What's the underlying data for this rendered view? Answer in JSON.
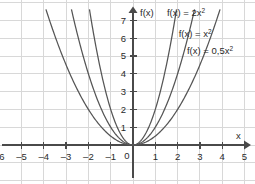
{
  "chart_data": {
    "type": "line",
    "title": "",
    "xlabel": "x",
    "ylabel": "f(x)",
    "xlim": [
      -6.5,
      5.6
    ],
    "ylim": [
      -1.3,
      7.6
    ],
    "grid": true,
    "legend_position": "in-plot-annotations",
    "x_ticks": [
      "-6",
      "-5",
      "-4",
      "-3",
      "-2",
      "-1",
      "0",
      "1",
      "2",
      "3",
      "4",
      "5"
    ],
    "x_tick_values": [
      -6,
      -5,
      -4,
      -3,
      -2,
      -1,
      0,
      1,
      2,
      3,
      4,
      5
    ],
    "y_ticks": [
      "1",
      "2",
      "3",
      "4",
      "5",
      "6",
      "7"
    ],
    "y_tick_values": [
      1,
      2,
      3,
      4,
      5,
      6,
      7
    ],
    "origin_label": "0",
    "series": [
      {
        "name": "f(x) = 2x²",
        "label_base": "f(x) = 2x",
        "label_exponent": "2",
        "coefficient": 2,
        "color": "#555555",
        "x": [
          -1.95,
          -1.5,
          -1.0,
          -0.5,
          0,
          0.5,
          1.0,
          1.5,
          1.95
        ],
        "y": [
          7.6,
          4.5,
          2.0,
          0.5,
          0,
          0.5,
          2.0,
          4.5,
          7.6
        ]
      },
      {
        "name": "f(x) = x²",
        "label_base": "f(x) = x",
        "label_exponent": "2",
        "coefficient": 1,
        "color": "#555555",
        "x": [
          -2.76,
          -2.0,
          -1.0,
          0,
          1.0,
          2.0,
          2.76
        ],
        "y": [
          7.6,
          4.0,
          1.0,
          0,
          1.0,
          4.0,
          7.6
        ]
      },
      {
        "name": "f(x) = 0,5x²",
        "label_base": "f(x) = 0,5x",
        "label_exponent": "2",
        "coefficient": 0.5,
        "color": "#555555",
        "x": [
          -3.9,
          -3.0,
          -2.0,
          -1.0,
          0,
          1.0,
          2.0,
          3.0,
          3.9
        ],
        "y": [
          7.6,
          4.5,
          2.0,
          0.5,
          0,
          0.5,
          2.0,
          4.5,
          7.6
        ]
      }
    ],
    "annotations": [
      {
        "text": "f(x) = 2x²",
        "x": 1.52,
        "y": 7.22
      },
      {
        "text": "f(x) = x²",
        "x": 2.05,
        "y": 6.08
      },
      {
        "text": "f(x) = 0,5x²",
        "x": 2.42,
        "y": 5.12
      }
    ],
    "colors": {
      "grid": "#d8d8d8",
      "axis": "#4a4a4a",
      "curve": "#555555",
      "text": "#2a2a2a",
      "background": "#ffffff"
    }
  }
}
